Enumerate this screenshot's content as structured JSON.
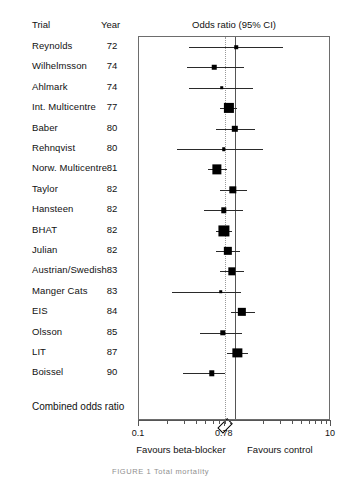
{
  "figure": {
    "caption": "FIGURE 1  Total mortality",
    "columns": {
      "trial_header": "Trial",
      "year_header": "Year"
    },
    "combined_label": "Combined odds ratio"
  },
  "chart_data": {
    "type": "forest",
    "title": "Odds ratio (95% CI)",
    "xlabel": "",
    "ylabel": "",
    "scale": "log",
    "xlim": [
      0.1,
      10
    ],
    "xticks": [
      0.1,
      0.78,
      10
    ],
    "xtick_labels": [
      "0.1",
      "0.78",
      "10"
    ],
    "minor_ticks": [
      0.2,
      0.3,
      0.4,
      0.5,
      0.6,
      0.7,
      0.8,
      0.9,
      2,
      3,
      4,
      5,
      6,
      7,
      8,
      9
    ],
    "null_line": 1.0,
    "pooled_line": 0.78,
    "grid": false,
    "legend": null,
    "favours_left": "Favours beta-blocker",
    "favours_right": "Favours control",
    "pooled": {
      "label": "Combined odds ratio",
      "or": 0.78,
      "ci_low": 0.71,
      "ci_high": 0.87
    },
    "studies": [
      {
        "trial": "Reynolds",
        "year": "72",
        "or": 1.03,
        "ci_low": 0.33,
        "ci_high": 3.2,
        "weight": 1
      },
      {
        "trial": "Wilhelmsson",
        "year": "74",
        "or": 0.61,
        "ci_low": 0.32,
        "ci_high": 1.25,
        "weight": 2
      },
      {
        "trial": "Ahlmark",
        "year": "74",
        "or": 0.73,
        "ci_low": 0.33,
        "ci_high": 1.55,
        "weight": 1
      },
      {
        "trial": "Int. Multicentre",
        "year": "77",
        "or": 0.86,
        "ci_low": 0.7,
        "ci_high": 1.04,
        "weight": 8
      },
      {
        "trial": "Baber",
        "year": "80",
        "or": 1.0,
        "ci_low": 0.63,
        "ci_high": 1.6,
        "weight": 4
      },
      {
        "trial": "Rehnqvist",
        "year": "80",
        "or": 0.76,
        "ci_low": 0.25,
        "ci_high": 1.95,
        "weight": 1
      },
      {
        "trial": "Norw. Multicentre",
        "year": "81",
        "or": 0.65,
        "ci_low": 0.52,
        "ci_high": 0.82,
        "weight": 7
      },
      {
        "trial": "Taylor",
        "year": "82",
        "or": 0.95,
        "ci_low": 0.7,
        "ci_high": 1.33,
        "weight": 5
      },
      {
        "trial": "Hansteen",
        "year": "82",
        "or": 0.76,
        "ci_low": 0.48,
        "ci_high": 1.22,
        "weight": 3
      },
      {
        "trial": "BHAT",
        "year": "82",
        "or": 0.77,
        "ci_low": 0.64,
        "ci_high": 0.93,
        "weight": 9
      },
      {
        "trial": "Julian",
        "year": "82",
        "or": 0.84,
        "ci_low": 0.64,
        "ci_high": 1.12,
        "weight": 6
      },
      {
        "trial": "Austrian/Swedish",
        "year": "83",
        "or": 0.92,
        "ci_low": 0.7,
        "ci_high": 1.25,
        "weight": 5
      },
      {
        "trial": "Manger Cats",
        "year": "83",
        "or": 0.71,
        "ci_low": 0.22,
        "ci_high": 1.15,
        "weight": 1
      },
      {
        "trial": "EIS",
        "year": "84",
        "or": 1.18,
        "ci_low": 0.9,
        "ci_high": 1.62,
        "weight": 6
      },
      {
        "trial": "Olsson",
        "year": "85",
        "or": 0.75,
        "ci_low": 0.43,
        "ci_high": 1.18,
        "weight": 3
      },
      {
        "trial": "LIT",
        "year": "87",
        "or": 1.06,
        "ci_low": 0.82,
        "ci_high": 1.38,
        "weight": 7
      },
      {
        "trial": "Boissel",
        "year": "90",
        "or": 0.57,
        "ci_low": 0.29,
        "ci_high": 0.78,
        "weight": 3
      }
    ]
  }
}
